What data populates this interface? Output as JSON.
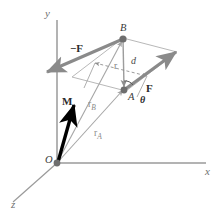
{
  "figure": {
    "background_color": "#ffffff",
    "width": 218,
    "height": 215
  },
  "colors": {
    "axis": "#9a9a9a",
    "force_arrow": "#8a8a8a",
    "plane_edge": "#b4b4b4",
    "moment_arrow": "#000000",
    "position_vector": "#a6a6a6",
    "dashed": "#8f8f8f",
    "point_dot": "#6e6e6e",
    "text": "#2b2b2b"
  },
  "axes": [
    {
      "id": "y",
      "label": "y",
      "direction": "up"
    },
    {
      "id": "x",
      "label": "x",
      "direction": "right"
    },
    {
      "id": "z",
      "label": "z",
      "direction": "lower-left"
    }
  ],
  "points": [
    {
      "id": "O",
      "label": "O",
      "role": "origin"
    },
    {
      "id": "A",
      "label": "A",
      "role": "force-application-point"
    },
    {
      "id": "B",
      "label": "B",
      "role": "opposite-force-application-point"
    }
  ],
  "vectors": [
    {
      "id": "F",
      "label": "F",
      "style": "bold",
      "role": "force-positive"
    },
    {
      "id": "-F",
      "label": "−F",
      "style": "bold",
      "role": "force-negative"
    },
    {
      "id": "M",
      "label": "M",
      "style": "bold",
      "role": "couple-moment"
    },
    {
      "id": "rA",
      "label": "r",
      "subscript": "A",
      "role": "position-vector-to-A"
    },
    {
      "id": "rB",
      "label": "r",
      "subscript": "B",
      "role": "position-vector-to-B"
    },
    {
      "id": "r",
      "label": "r",
      "role": "relative-position-vector"
    }
  ],
  "scalars": [
    {
      "id": "d",
      "label": "d",
      "role": "perpendicular-distance"
    },
    {
      "id": "theta",
      "label": "θ",
      "role": "angle-between-r-and-F"
    }
  ]
}
